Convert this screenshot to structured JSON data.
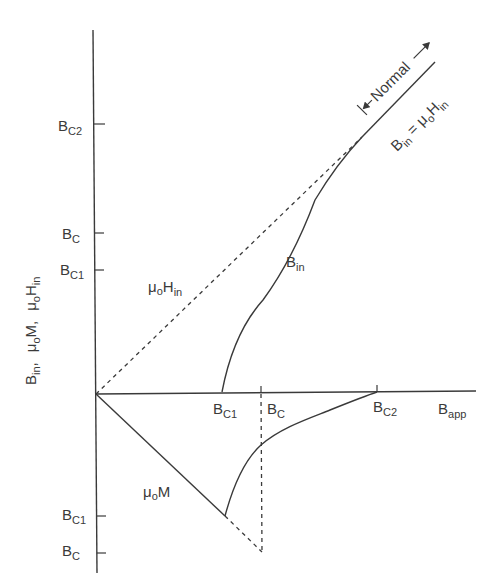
{
  "diagram": {
    "type": "superconductor magnetization curve (type II)",
    "y_axis": {
      "label_parts": [
        {
          "main": "B",
          "sub": "in",
          "suffix": ","
        },
        {
          "main": "μ",
          "sub": "o",
          "main2": "M",
          "suffix": ","
        },
        {
          "main": "μ",
          "sub": "o",
          "main2": "H",
          "sub2": "in"
        }
      ],
      "ticks_positive": [
        {
          "main": "B",
          "sub": "C2"
        },
        {
          "main": "B",
          "sub": "C"
        },
        {
          "main": "B",
          "sub": "C1"
        }
      ],
      "ticks_negative": [
        {
          "main": "B",
          "sub": "C1"
        },
        {
          "main": "B",
          "sub": "C"
        }
      ]
    },
    "x_axis": {
      "label": {
        "main": "B",
        "sub": "app"
      },
      "ticks": [
        {
          "main": "B",
          "sub": "C1"
        },
        {
          "main": "B",
          "sub": "C"
        },
        {
          "main": "B",
          "sub": "C2"
        }
      ]
    },
    "curves": {
      "b_in": {
        "main": "B",
        "sub": "in"
      },
      "mu_h_in": {
        "main": "μ",
        "sub": "o",
        "main2": "H",
        "sub2": "in"
      },
      "mu_m": {
        "main": "μ",
        "sub": "o",
        "main2": "M"
      }
    },
    "annotations": {
      "normal_region": "Normal",
      "normal_relation": {
        "main": "B",
        "sub": "in",
        "eq": " = ",
        "main2": "μ",
        "sub2": "o",
        "main3": "H",
        "sub3": "in"
      }
    },
    "colors": {
      "line": "#3a3a3a",
      "background": "#ffffff"
    }
  }
}
